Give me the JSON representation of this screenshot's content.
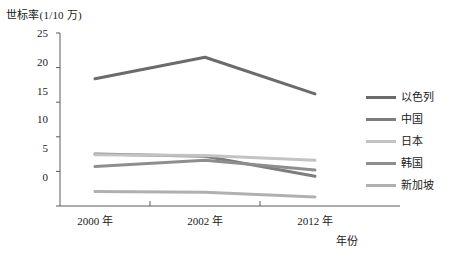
{
  "chart_data": {
    "type": "line",
    "title": "",
    "ylabel": "世标率(1/10 万)",
    "xlabel": "年份",
    "categories": [
      "2000 年",
      "2002 年",
      "2012 年"
    ],
    "x": [
      2000,
      2002,
      2012
    ],
    "ylim": [
      0,
      25
    ],
    "yticks": [
      0,
      5,
      10,
      15,
      20,
      25
    ],
    "grid": false,
    "legend_position": "right",
    "series": [
      {
        "name": "以色列",
        "values": [
          18.4,
          21.5,
          16.2
        ],
        "color": "#6b6b6b"
      },
      {
        "name": "中国",
        "values": [
          7.5,
          7.2,
          4.3
        ],
        "color": "#7d7d7d"
      },
      {
        "name": "日本",
        "values": [
          7.4,
          7.3,
          6.6
        ],
        "color": "#c3c3c3"
      },
      {
        "name": "韩国",
        "values": [
          5.7,
          6.6,
          5.2
        ],
        "color": "#8e8e8e"
      },
      {
        "name": "新加坡",
        "values": [
          2.1,
          2.0,
          1.3
        ],
        "color": "#b0b0b0"
      }
    ]
  },
  "axis": {
    "y_tick_labels": [
      "25",
      "20",
      "15",
      "10",
      "5",
      "0"
    ],
    "x_tick_labels": [
      "2000 年",
      "2002 年",
      "2012 年"
    ]
  },
  "legend": {
    "items": [
      {
        "label": "以色列"
      },
      {
        "label": "中国"
      },
      {
        "label": "日本"
      },
      {
        "label": "韩国"
      },
      {
        "label": "新加坡"
      }
    ]
  },
  "colors": {
    "axis": "#5a5a5a",
    "text": "#1a1a1a",
    "background": "#ffffff"
  }
}
